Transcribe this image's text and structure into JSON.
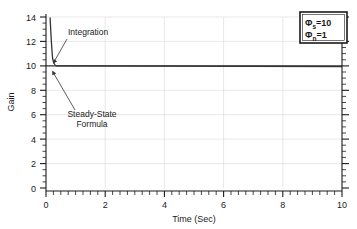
{
  "chart_data": {
    "type": "line",
    "title": "",
    "xlabel": "Time (Sec)",
    "ylabel": "Gain",
    "xlim": [
      0,
      10
    ],
    "ylim": [
      0,
      15
    ],
    "grid": true,
    "x_ticks": [
      0,
      2,
      4,
      6,
      8,
      10
    ],
    "x_tick_labels": [
      "0",
      "2",
      "4",
      "6",
      "8",
      "10"
    ],
    "y_ticks": [
      0,
      2,
      4,
      6,
      8,
      10,
      12,
      14
    ],
    "y_tick_labels": [
      "0",
      "2",
      "4",
      "6",
      "8",
      "10",
      "12",
      "14"
    ],
    "x_minor_step": 0.25,
    "y_minor_step": 0.5,
    "series": [
      {
        "name": "Integration",
        "x": [
          0.14,
          0.16,
          0.18,
          0.2,
          0.22,
          0.24,
          0.26,
          0.28,
          0.3,
          0.33,
          0.36,
          0.4,
          0.45,
          0.5,
          0.6,
          0.8,
          1.0,
          1.5,
          2.0,
          3.0,
          4.0,
          5.0,
          6.0,
          7.0,
          8.0,
          9.0,
          10.0
        ],
        "y": [
          13.1,
          12.7,
          12.3,
          11.9,
          11.5,
          11.2,
          10.9,
          10.7,
          10.5,
          10.3,
          10.2,
          10.12,
          10.07,
          10.04,
          10.02,
          10.0,
          10.0,
          9.98,
          9.97,
          9.96,
          9.95,
          9.95,
          9.94,
          9.94,
          9.93,
          9.93,
          9.93
        ]
      },
      {
        "name": "Steady-State Formula",
        "x": [
          0.0,
          10.0
        ],
        "y": [
          10.0,
          10.0
        ]
      }
    ],
    "annotations": [
      {
        "id": "integration",
        "text": "Integration",
        "text_x": 1.2,
        "text_y": 13.5,
        "point_x": 0.3,
        "point_y": 10.7
      },
      {
        "id": "steady-state-formula",
        "text_line1": "Steady-State",
        "text_line2": "Formula",
        "text_x": 1.1,
        "text_y": 6.2,
        "point_x": 0.28,
        "point_y": 9.7
      }
    ],
    "legend": {
      "position": "top-right",
      "entries": [
        {
          "symbol": "Φ",
          "subscript": "s",
          "relation": "=",
          "value": "10"
        },
        {
          "symbol": "Φ",
          "subscript": "n",
          "relation": "=",
          "value": "1"
        }
      ]
    }
  }
}
